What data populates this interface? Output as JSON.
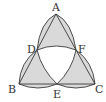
{
  "diagram": {
    "type": "geometry",
    "colors": {
      "stroke": "#3a3a3a",
      "shade": "#d9d9d9",
      "background": "#ffffff"
    },
    "points": {
      "A": {
        "label": "A",
        "x": 56,
        "y": 14
      },
      "B": {
        "label": "B",
        "x": 19,
        "y": 84
      },
      "C": {
        "label": "C",
        "x": 95,
        "y": 84
      },
      "D": {
        "label": "D",
        "x": 37,
        "y": 50
      },
      "E": {
        "label": "E",
        "x": 57,
        "y": 84
      },
      "F": {
        "label": "F",
        "x": 76,
        "y": 50
      }
    },
    "labels": {
      "A": "A",
      "B": "B",
      "C": "C",
      "D": "D",
      "E": "E",
      "F": "F"
    }
  }
}
